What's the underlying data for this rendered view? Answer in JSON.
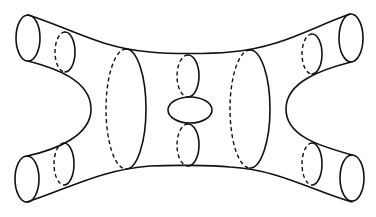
{
  "figure": {
    "type": "line-drawing",
    "colors": {
      "stroke": "#111111",
      "background": "#ffffff"
    },
    "labels": []
  }
}
